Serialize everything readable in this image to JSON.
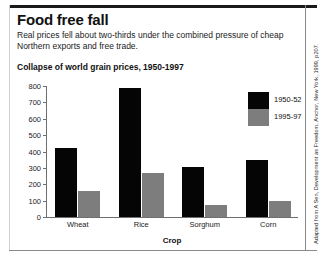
{
  "headline": {
    "title": "Food free fall",
    "subtitle": "Real prices fell about two-thirds under the combined pressure of cheap Northern exports and free trade."
  },
  "source": {
    "text": "Adapted from A Sen, Development as Freedom, Anchor, New York, 1999, p207."
  },
  "colors": {
    "series_1950": "#050505",
    "series_1995": "#7d7d7d",
    "axis": "#6f6f6f",
    "rule": "#1a1a1a"
  },
  "chart_data": {
    "type": "bar",
    "title": "Collapse of world grain prices, 1950-1997",
    "xlabel": "Crop",
    "ylabel": "Price per ton",
    "categories": [
      "Wheat",
      "Rice",
      "Sorghum",
      "Corn"
    ],
    "series": [
      {
        "name": "1950-52",
        "values": [
          420,
          790,
          305,
          350
        ]
      },
      {
        "name": "1995-97",
        "values": [
          160,
          270,
          75,
          95
        ]
      }
    ],
    "ylim": [
      0,
      800
    ],
    "yticks": [
      0,
      100,
      200,
      300,
      400,
      500,
      600,
      700,
      800
    ],
    "ytick_labels": [
      "0",
      "100",
      "200",
      "300",
      "400",
      "500",
      "600",
      "700",
      "800"
    ],
    "grid": false,
    "legend_position": "top-right"
  }
}
